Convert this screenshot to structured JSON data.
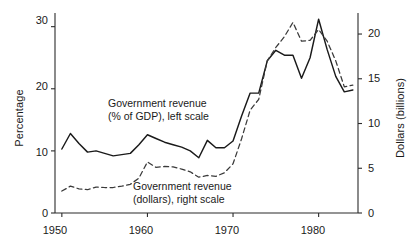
{
  "chart_data": {
    "type": "line",
    "title": "",
    "subtitle": "",
    "xlabel": "",
    "ylabel": "Percentage",
    "y2label": "Dollars (billions)",
    "xlim": [
      1949.2,
      1984.6
    ],
    "ylim": [
      0,
      32.2
    ],
    "y2lim": [
      0,
      22.35
    ],
    "grid": false,
    "legend_position": "inline-annotation",
    "x_ticks": [
      1950,
      1960,
      1970,
      1980
    ],
    "x_tick_labels": [
      "1950",
      "1960",
      "1970",
      "1980"
    ],
    "y_ticks": [
      0,
      10,
      20,
      30
    ],
    "y_tick_labels": [
      "0",
      "10",
      "20",
      "30"
    ],
    "y2_ticks": [
      0,
      5,
      10,
      15,
      20
    ],
    "y2_tick_labels": [
      "0",
      "5",
      "10",
      "15",
      "20"
    ],
    "series": [
      {
        "name": "Government revenue (% of GDP), left scale",
        "style": "solid",
        "color": "#1a1a1a",
        "axis": "left",
        "x": [
          1950,
          1951,
          1952,
          1953,
          1954,
          1955,
          1956,
          1957,
          1958,
          1959,
          1960,
          1961,
          1962,
          1963,
          1964,
          1965,
          1966,
          1967,
          1968,
          1969,
          1970,
          1971,
          1972,
          1973,
          1974,
          1975,
          1976,
          1977,
          1978,
          1979,
          1980,
          1981,
          1982,
          1983,
          1984
        ],
        "values": [
          10.3,
          12.8,
          11.2,
          9.8,
          10.0,
          9.6,
          9.2,
          9.4,
          9.6,
          11.0,
          12.6,
          12.0,
          11.4,
          11.0,
          10.6,
          10.0,
          8.9,
          11.7,
          10.5,
          10.5,
          11.6,
          15.6,
          19.3,
          19.3,
          24.5,
          26.2,
          25.4,
          25.4,
          21.7,
          25.0,
          31.2,
          26.3,
          22.0,
          19.5,
          19.8
        ]
      },
      {
        "name": "Government revenue (dollars), right scale",
        "style": "dashed",
        "color": "#3a3a3a",
        "axis": "right",
        "x": [
          1950,
          1951,
          1952,
          1953,
          1954,
          1955,
          1956,
          1957,
          1958,
          1959,
          1960,
          1961,
          1962,
          1963,
          1964,
          1965,
          1966,
          1967,
          1968,
          1969,
          1970,
          1971,
          1972,
          1973,
          1974,
          1975,
          1976,
          1977,
          1978,
          1979,
          1980,
          1981,
          1982,
          1983,
          1984
        ],
        "values": [
          2.45,
          3.0,
          2.7,
          2.6,
          2.9,
          2.85,
          2.85,
          3.0,
          3.2,
          3.9,
          5.7,
          5.1,
          5.2,
          5.15,
          4.9,
          4.6,
          4.0,
          4.2,
          4.1,
          4.5,
          5.5,
          8.3,
          11.5,
          12.7,
          17.0,
          18.5,
          19.7,
          21.3,
          19.2,
          19.3,
          20.5,
          19.2,
          17.0,
          14.1,
          14.3
        ]
      }
    ],
    "annotations": [
      {
        "name": "percent-series-label",
        "line1": "Government revenue",
        "line2": "(% of GDP), left scale",
        "x_px": 108,
        "y_px": 97
      },
      {
        "name": "dollars-series-label",
        "line1": "Government revenue",
        "line2": "(dollars), right scale",
        "x_px": 133,
        "y_px": 180
      }
    ]
  },
  "caption_fragment": ""
}
